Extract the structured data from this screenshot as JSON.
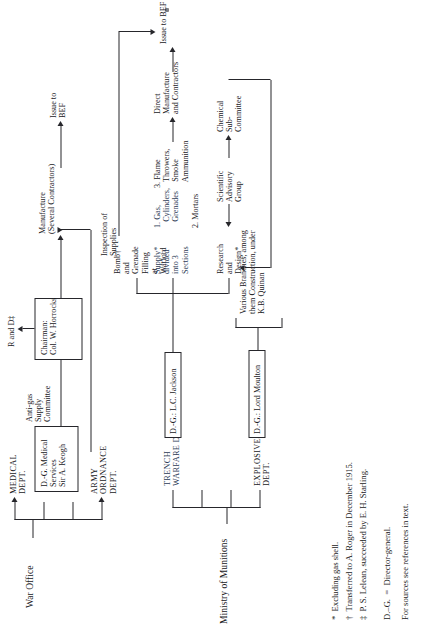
{
  "figure": {
    "orientation": "rotated-90-ccw",
    "war_office": {
      "root": "War Office",
      "branches": [
        {
          "label": "MEDICAL\nDEPT."
        },
        {
          "label": ""
        },
        {
          "label": ""
        },
        {
          "label": "ARMY\nORDNANCE\nDEPT."
        }
      ],
      "medical_box": "D.-G. Medical\nServices\nSir A. Keogh",
      "anti_gas": "Anti-gas\nSupply\nCommittee",
      "chairman_box": "Chairman:\nCol. W. Horrocks",
      "r_and_d": "R and D‡",
      "inspection": "Inspection of\nSupplies",
      "manufacture": "Manufacture\n(Several Contractors)",
      "issue": "Issue to\nBEF"
    },
    "munitions": {
      "root": "Ministry of Munitions",
      "branches": [
        {
          "label": "EXPLOSIVES\nDEPT."
        },
        {
          "label": ""
        },
        {
          "label": ""
        },
        {
          "label": "TRENCH\nWARFARE DEPT."
        }
      ],
      "explosives_box": "D.-G.: Lord Moulton",
      "various_branches": "Various Branches, among\nthem Construction, under\nK.B. Quinan",
      "trench_box": "D.-G.: L.C. Jackson",
      "research": "Research\nand\nDesign*",
      "scientific": "Scientific\nAdvisory\nGroup",
      "chemical": "Chemical\nSub-\nCommittee",
      "supply": "Supply*\ndivided\ninto 3\nSections",
      "sections": [
        "1. Gas,\n   Cylinders,\n   Grenades",
        "2. Mortars",
        "3. Flame\n   Throwers,\n   Smoke\n   Ammunition"
      ],
      "bomb": "Bomb†\nand\nGrenade\nFilling\nat\nWatford",
      "direct": "Direct\nManufacture\nand Contractors",
      "issue": "Issue to BEF"
    },
    "footnotes": [
      "*  Excluding gas shell.",
      "†  Transferred to A. Roger in December 1915.",
      "‡  P. S. Lelean, succeeded by E. H. Starling."
    ],
    "legend": "D.–G.  =  Director-general.",
    "sources": "For sources see references in text."
  },
  "colors": {
    "ink": "#18181c",
    "rule": "#26262b",
    "paper": "#ffffff"
  }
}
